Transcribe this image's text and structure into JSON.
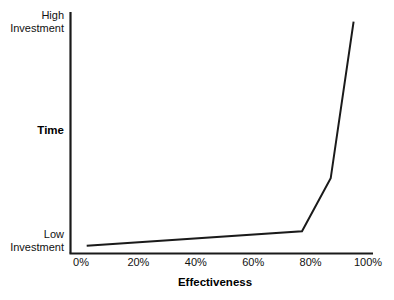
{
  "chart_data": {
    "type": "line",
    "title": "",
    "xlabel": "Effectiveness",
    "ylabel": "Time",
    "x": [
      2,
      77,
      87,
      95
    ],
    "values": [
      3,
      9,
      31,
      96
    ],
    "series": [
      {
        "name": "Time vs Effectiveness",
        "points": [
          {
            "x": 2,
            "y": 3
          },
          {
            "x": 77,
            "y": 9
          },
          {
            "x": 87,
            "y": 31
          },
          {
            "x": 95,
            "y": 96
          }
        ]
      }
    ],
    "xlim": [
      0,
      100
    ],
    "ylim": [
      0,
      100
    ],
    "xtick_labels": [
      "0%",
      "20%",
      "40%",
      "60%",
      "80%",
      "100%"
    ],
    "xtick_values": [
      0,
      20,
      40,
      60,
      80,
      100
    ],
    "ytick_labels": [
      "Low\nInvestment",
      "High\nInvestment"
    ],
    "ytick_values": [
      0,
      100
    ],
    "grid": false,
    "legend": false,
    "line_color": "#1a1a1a",
    "axis_color": "#1a1a1a"
  },
  "axes": {
    "y_top_label": "High\nInvestment",
    "y_bottom_label": "Low\nInvestment",
    "y_title": "Time",
    "x_title": "Effectiveness"
  },
  "ticks": {
    "x": [
      {
        "label": "0%",
        "value": 0
      },
      {
        "label": "20%",
        "value": 20
      },
      {
        "label": "40%",
        "value": 40
      },
      {
        "label": "60%",
        "value": 60
      },
      {
        "label": "80%",
        "value": 80
      },
      {
        "label": "100%",
        "value": 100
      }
    ]
  }
}
